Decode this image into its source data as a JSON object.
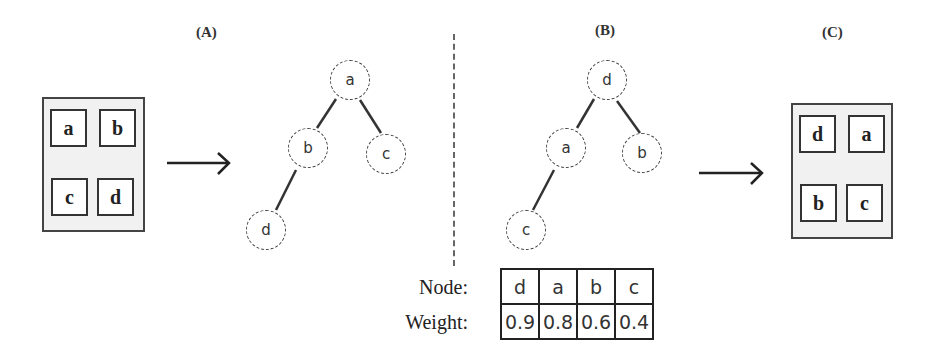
{
  "panels": {
    "A": {
      "label": "(A)"
    },
    "B": {
      "label": "(B)"
    },
    "C": {
      "label": "(C)"
    }
  },
  "input_grid": {
    "cells": [
      "a",
      "b",
      "c",
      "d"
    ]
  },
  "output_grid": {
    "cells": [
      "d",
      "a",
      "b",
      "c"
    ]
  },
  "tree_A": {
    "nodes": [
      "a",
      "b",
      "c",
      "d"
    ],
    "edges": [
      [
        "a",
        "b"
      ],
      [
        "a",
        "c"
      ],
      [
        "b",
        "d"
      ]
    ]
  },
  "tree_B": {
    "nodes": [
      "d",
      "a",
      "b",
      "c"
    ],
    "edges": [
      [
        "d",
        "a"
      ],
      [
        "d",
        "b"
      ],
      [
        "a",
        "c"
      ]
    ]
  },
  "weight_table": {
    "row_labels": {
      "node": "Node:",
      "weight": "Weight:"
    },
    "nodes": [
      "d",
      "a",
      "b",
      "c"
    ],
    "weights": [
      "0.9",
      "0.8",
      "0.6",
      "0.4"
    ]
  },
  "arrows": {
    "glyph": "→"
  }
}
